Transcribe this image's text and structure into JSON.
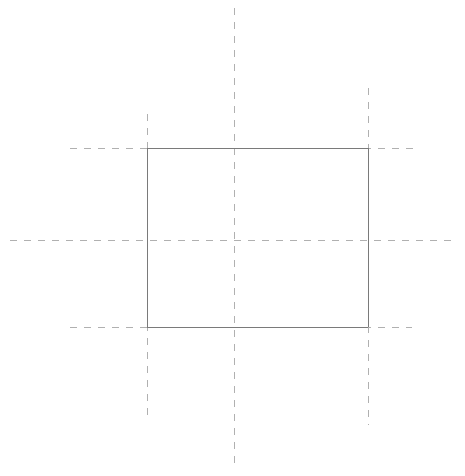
{
  "canvas": {
    "width": 465,
    "height": 476,
    "background_color": "#ffffff",
    "title": "Rectangle with construction centerlines"
  },
  "style": {
    "solid_color": "#7a7a7a",
    "solid_width": 1,
    "dashed_color": "#b0b0b0",
    "dashed_width": 1,
    "dash_pattern": "7 7"
  },
  "geometry": {
    "rectangle": {
      "label": "outline-rectangle",
      "x": 147,
      "y": 148,
      "width": 221,
      "height": 179,
      "left": 147,
      "right": 368,
      "top": 148,
      "bottom": 327
    },
    "center": {
      "x": 234,
      "y": 240
    }
  },
  "construction_lines": [
    {
      "name": "center-vertical-line",
      "orientation": "vertical",
      "x": 234,
      "y1": 8,
      "y2": 470
    },
    {
      "name": "center-horizontal-line",
      "orientation": "horizontal",
      "y": 240,
      "x1": 10,
      "x2": 452
    },
    {
      "name": "left-edge-extension-line",
      "orientation": "vertical",
      "x": 147,
      "y1": 114,
      "y2": 420
    },
    {
      "name": "right-edge-extension-line",
      "orientation": "vertical",
      "x": 368,
      "y1": 88,
      "y2": 425
    },
    {
      "name": "top-edge-extension-line",
      "orientation": "horizontal",
      "y": 148,
      "x1": 70,
      "x2": 415
    },
    {
      "name": "bottom-edge-extension-line",
      "orientation": "horizontal",
      "y": 327,
      "x1": 70,
      "x2": 412
    }
  ],
  "rectangle_edges": [
    {
      "name": "rect-top-edge",
      "x1": 147,
      "y1": 148,
      "x2": 368,
      "y2": 148
    },
    {
      "name": "rect-right-edge",
      "x1": 368,
      "y1": 148,
      "x2": 368,
      "y2": 327
    },
    {
      "name": "rect-bottom-edge",
      "x1": 147,
      "y1": 327,
      "x2": 368,
      "y2": 327
    },
    {
      "name": "rect-left-edge",
      "x1": 147,
      "y1": 148,
      "x2": 147,
      "y2": 327
    }
  ]
}
